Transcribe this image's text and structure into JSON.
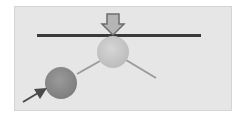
{
  "diagram": {
    "type": "physics-illustration",
    "colors": {
      "background": "#e6e6e6",
      "bar": "#3a3a3a",
      "upper_ball": "#c8c8c8",
      "lower_ball": "#8c8c8c",
      "connector": "#9a9a9a",
      "down_arrow_fill": "#b5b5b5",
      "down_arrow_stroke": "#6e6e6e",
      "diagonal_arrow": "#4a4a4a"
    },
    "elements": [
      {
        "name": "horizontal-bar"
      },
      {
        "name": "down-arrow"
      },
      {
        "name": "upper-ball"
      },
      {
        "name": "lower-ball"
      },
      {
        "name": "connector-line-left"
      },
      {
        "name": "connector-line-right"
      },
      {
        "name": "diagonal-arrow"
      }
    ]
  }
}
